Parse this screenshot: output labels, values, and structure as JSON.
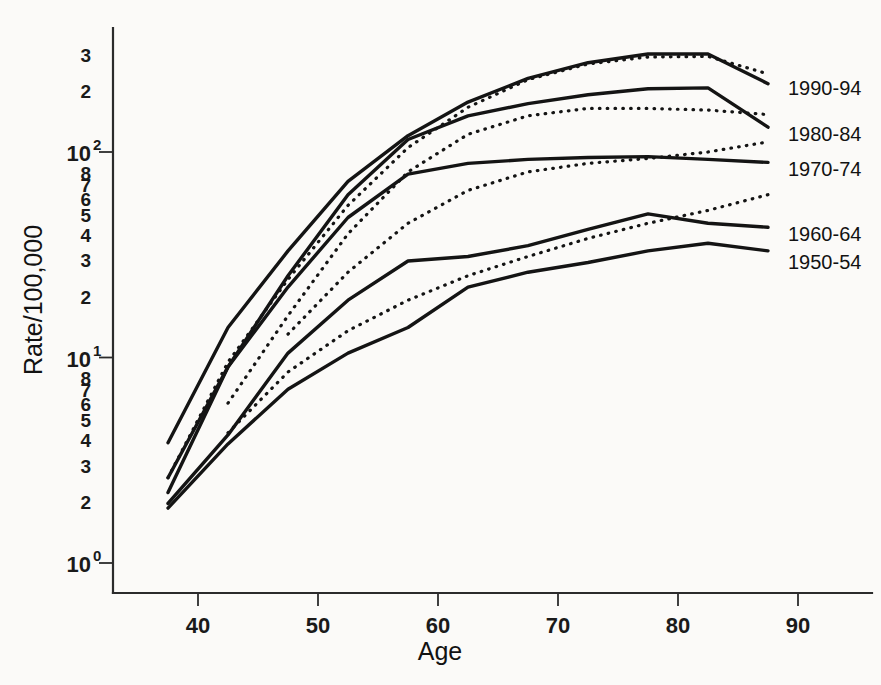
{
  "chart_data": {
    "type": "line",
    "title": "",
    "xlabel": "Age",
    "ylabel": "Rate/100,000",
    "xlim": [
      33,
      95
    ],
    "ylim": [
      1,
      400
    ],
    "yscale": "log",
    "grid": false,
    "legend_position": "right-inline",
    "x_tick_labels": [
      "40",
      "50",
      "60",
      "70",
      "80",
      "90"
    ],
    "x_ticks": [
      40,
      50,
      60,
      70,
      80,
      90
    ],
    "y_major_ticks": [
      1,
      10,
      100
    ],
    "y_major_tick_labels": [
      "10",
      "10",
      "10"
    ],
    "y_major_tick_exponents": [
      "0",
      "1",
      "2"
    ],
    "y_minor_tick_labels_decade1": [
      "2",
      "3",
      "4",
      "5",
      "6",
      "7",
      "8"
    ],
    "y_minor_tick_labels_decade2": [
      "2",
      "3",
      "4",
      "5",
      "6",
      "7",
      "8"
    ],
    "y_minor_tick_labels_above": [
      "2",
      "3"
    ],
    "series": [
      {
        "name": "1990-94",
        "label": "1990-94",
        "style": "solid",
        "label_y_value": 205,
        "x": [
          37.5,
          42.5,
          47.5,
          52.5,
          57.5,
          62.5,
          67.5,
          72.5,
          77.5,
          82.5,
          87.5
        ],
        "y": [
          3.85,
          14.0,
          33.0,
          72.0,
          120.0,
          175.0,
          228.0,
          272.0,
          300.0,
          300.0,
          215.0
        ]
      },
      {
        "name": "1990-94-cohort",
        "label": "",
        "style": "dotted",
        "x": [
          37.5,
          42.5,
          47.5,
          52.5,
          57.5,
          62.5,
          67.5,
          72.5,
          77.5,
          82.5,
          87.5
        ],
        "y": [
          2.6,
          9.5,
          24.0,
          55.0,
          105.0,
          165.0,
          225.0,
          268.0,
          290.0,
          292.0,
          240.0
        ]
      },
      {
        "name": "1980-84",
        "label": "1980-84",
        "style": "solid",
        "label_y_value": 122,
        "x": [
          37.5,
          42.5,
          47.5,
          52.5,
          57.5,
          62.5,
          67.5,
          72.5,
          77.5,
          82.5,
          87.5
        ],
        "y": [
          2.6,
          9.0,
          25.0,
          62.0,
          115.0,
          150.0,
          172.0,
          190.0,
          203.0,
          205.0,
          132.0
        ]
      },
      {
        "name": "1980-84-cohort",
        "label": "",
        "style": "dotted",
        "x": [
          42.5,
          47.5,
          52.5,
          57.5,
          62.5,
          67.5,
          72.5,
          77.5,
          82.5,
          87.5
        ],
        "y": [
          6.0,
          16.0,
          40.0,
          80.0,
          122.0,
          150.0,
          163.0,
          163.0,
          160.0,
          152.0
        ]
      },
      {
        "name": "1970-74",
        "label": "1970-74",
        "style": "solid",
        "label_y_value": 83,
        "x": [
          37.5,
          42.5,
          47.5,
          52.5,
          57.5,
          62.5,
          67.5,
          72.5,
          77.5,
          82.5,
          87.5
        ],
        "y": [
          2.2,
          9.0,
          22.0,
          48.0,
          78.0,
          88.0,
          92.0,
          94.0,
          95.0,
          92.0,
          89.0
        ]
      },
      {
        "name": "1970-74-cohort",
        "label": "",
        "style": "dotted",
        "x": [
          47.5,
          52.5,
          57.5,
          62.5,
          67.5,
          72.5,
          77.5,
          82.5,
          87.5
        ],
        "y": [
          13.0,
          26.0,
          45.0,
          65.0,
          80.0,
          88.0,
          93.0,
          100.0,
          112.0
        ]
      },
      {
        "name": "1960-64",
        "label": "1960-64",
        "style": "solid",
        "label_y_value": 40,
        "x": [
          37.5,
          42.5,
          47.5,
          52.5,
          57.5,
          62.5,
          67.5,
          72.5,
          77.5,
          82.5,
          87.5
        ],
        "y": [
          1.95,
          4.2,
          10.5,
          19.0,
          29.5,
          31.0,
          35.0,
          42.0,
          50.0,
          45.0,
          43.0
        ]
      },
      {
        "name": "1960-64-cohort",
        "label": "",
        "style": "dotted",
        "x": [
          42.5,
          47.5,
          52.5,
          57.5,
          62.5,
          67.5,
          72.5,
          77.5,
          82.5,
          87.5
        ],
        "y": [
          4.3,
          8.5,
          13.5,
          19.0,
          25.0,
          31.0,
          38.0,
          45.0,
          52.0,
          62.0
        ]
      },
      {
        "name": "1950-54",
        "label": "1950-54",
        "style": "solid",
        "label_y_value": 29,
        "x": [
          37.5,
          42.5,
          47.5,
          52.5,
          57.5,
          62.5,
          67.5,
          72.5,
          77.5,
          82.5,
          87.5
        ],
        "y": [
          1.85,
          3.8,
          7.0,
          10.5,
          14.0,
          22.0,
          26.0,
          29.0,
          33.0,
          36.0,
          33.0
        ]
      }
    ]
  },
  "axis_titles": {
    "x": "Age",
    "y": "Rate/100,000"
  }
}
